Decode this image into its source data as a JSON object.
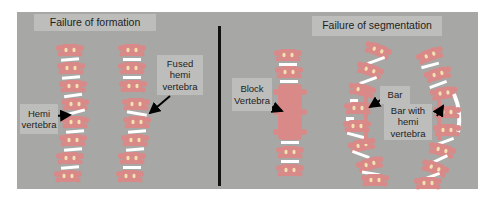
{
  "sections": {
    "left": {
      "title": "Failure of formation",
      "labels": {
        "hemi": "Hemi vertebra",
        "hemi_line1": "Hemi",
        "hemi_line2": "vertebra",
        "fused_line1": "Fused",
        "fused_line2": "hemi",
        "fused_line3": "vertebra"
      }
    },
    "right": {
      "title": "Failure of segmentation",
      "labels": {
        "block_line1": "Block",
        "block_line2": "Vertebra",
        "bar": "Bar",
        "barhemi_line1": "Bar with",
        "barhemi_line2": "hemi",
        "barhemi_line3": "vertebra"
      }
    }
  },
  "colors": {
    "background": "#a7a7a5",
    "label_box": "#bdbdbb",
    "vertebra": "#d98a88",
    "disc": "#ffffff",
    "arrow": "#000000"
  }
}
